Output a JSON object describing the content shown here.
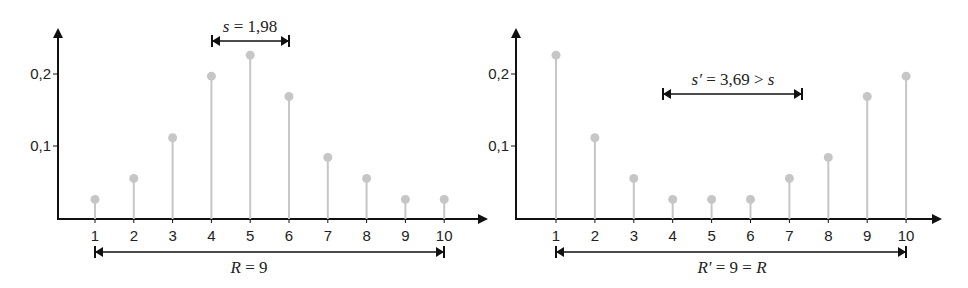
{
  "chart_data": [
    {
      "type": "stem",
      "title": "",
      "xlabel": "",
      "ylabel": "",
      "categories": [
        1,
        2,
        3,
        4,
        5,
        6,
        7,
        8,
        9,
        10
      ],
      "values": [
        0.027,
        0.056,
        0.112,
        0.197,
        0.226,
        0.169,
        0.085,
        0.056,
        0.027,
        0.027
      ],
      "y_ticks": [
        "0,2",
        "0,1"
      ],
      "y_tick_values": [
        0.2,
        0.1
      ],
      "x_tick_labels": [
        "1",
        "2",
        "3",
        "4",
        "5",
        "6",
        "7",
        "8",
        "9",
        "10"
      ],
      "grid": false,
      "annotations": {
        "spread": {
          "label_var": "s",
          "label_eq": " = 1,98",
          "from_x": 4.15,
          "to_x": 6.13,
          "y": 0.245
        },
        "range": {
          "label_var": "R",
          "label_eq": " = 9",
          "from_x": 1,
          "to_x": 10
        }
      }
    },
    {
      "type": "stem",
      "title": "",
      "xlabel": "",
      "ylabel": "",
      "categories": [
        1,
        2,
        3,
        4,
        5,
        6,
        7,
        8,
        9,
        10
      ],
      "values": [
        0.226,
        0.112,
        0.056,
        0.027,
        0.027,
        0.027,
        0.056,
        0.085,
        0.169,
        0.197
      ],
      "y_ticks": [
        "0,2",
        "0,1"
      ],
      "y_tick_values": [
        0.2,
        0.1
      ],
      "x_tick_labels": [
        "1",
        "2",
        "3",
        "4",
        "5",
        "6",
        "7",
        "8",
        "9",
        "10"
      ],
      "grid": false,
      "annotations": {
        "spread": {
          "label_var": "s′",
          "label_eq": " = 3,69 > ",
          "label_tail": "s",
          "from_x": 3.75,
          "to_x": 7.33,
          "y": 0.17
        },
        "range": {
          "label_var": "R′",
          "label_eq": " = 9 = ",
          "label_tail": "R",
          "from_x": 1,
          "to_x": 10
        }
      }
    }
  ],
  "colors": {
    "axis": "#111111",
    "stem": "#c6c6c6",
    "text": "#222222"
  }
}
